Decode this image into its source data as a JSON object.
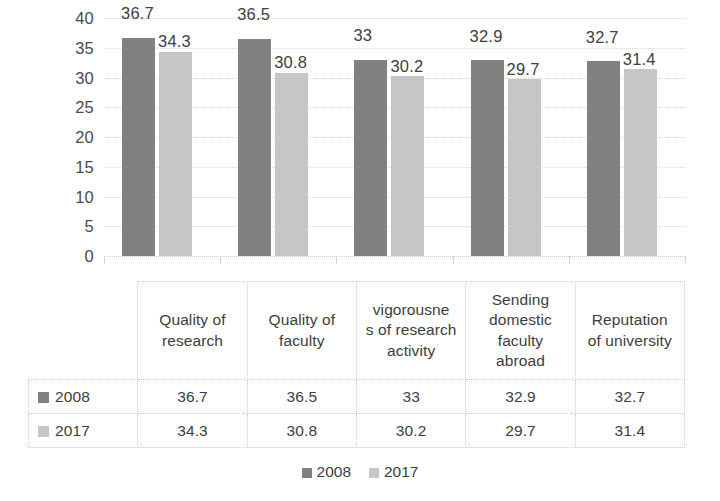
{
  "chart_data": {
    "type": "bar",
    "title": "",
    "subtitle": "",
    "xlabel": "",
    "ylabel": "",
    "ylim": [
      0,
      40
    ],
    "ytick_step": 5,
    "yticks": [
      "40",
      "35",
      "30",
      "25",
      "20",
      "15",
      "10",
      "5",
      "0"
    ],
    "grid": true,
    "legend_position": "bottom",
    "categories": [
      "Quality of research",
      "Quality of faculty",
      "vigorousness of research activity",
      "Sending domestic faculty abroad",
      "Reputation of university"
    ],
    "category_lines": [
      [
        "Quality of",
        "research"
      ],
      [
        "Quality of",
        "faculty"
      ],
      [
        "vigorousne",
        "s of research",
        "activity"
      ],
      [
        "Sending",
        "domestic",
        "faculty",
        "abroad"
      ],
      [
        "Reputation",
        "of university"
      ]
    ],
    "series": [
      {
        "name": "2008",
        "color": "#818181",
        "values": [
          36.7,
          36.5,
          33,
          32.9,
          32.7
        ],
        "labels": [
          "36.7",
          "36.5",
          "33",
          "32.9",
          "32.7"
        ]
      },
      {
        "name": "2017",
        "color": "#c6c6c6",
        "values": [
          34.3,
          30.8,
          30.2,
          29.7,
          31.4
        ],
        "labels": [
          "34.3",
          "30.8",
          "30.2",
          "29.7",
          "31.4"
        ]
      }
    ]
  },
  "legend": {
    "items": [
      {
        "label": "2008",
        "color": "#818181"
      },
      {
        "label": "2017",
        "color": "#c6c6c6"
      }
    ]
  },
  "table": {
    "row_headers": [
      "2008",
      "2017"
    ],
    "rows": [
      [
        "36.7",
        "36.5",
        "33",
        "32.9",
        "32.7"
      ],
      [
        "34.3",
        "30.8",
        "30.2",
        "29.7",
        "31.4"
      ]
    ]
  }
}
